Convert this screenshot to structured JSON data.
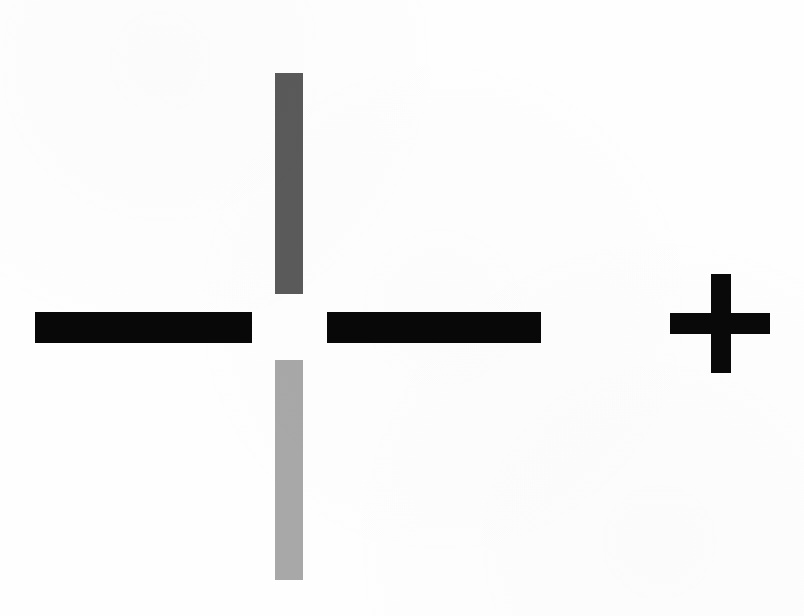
{
  "image": {
    "title": "Registration Crosshair Mark",
    "background_color": "#fefefe",
    "width": 804,
    "height": 616,
    "description": "Scanned registration / alignment target: four rectangular bars forming a crosshair with a central gap, plus a small solid plus sign at right."
  },
  "shapes": {
    "crosshair": {
      "name": "crosshair-registration-mark",
      "center_x": 289,
      "center_y": 327,
      "gap_width": 74,
      "gap_height": 66,
      "arms": [
        {
          "id": "arm-top",
          "orientation": "vertical",
          "color": "#5a5a5a",
          "tone_label": "dark gray",
          "x": 275,
          "y": 73,
          "width": 28,
          "height": 221
        },
        {
          "id": "arm-left",
          "orientation": "horizontal",
          "color": "#080808",
          "tone_label": "black",
          "x": 35,
          "y": 312,
          "width": 217,
          "height": 31
        },
        {
          "id": "arm-right",
          "orientation": "horizontal",
          "color": "#080808",
          "tone_label": "black",
          "x": 327,
          "y": 312,
          "width": 214,
          "height": 31
        },
        {
          "id": "arm-bottom",
          "orientation": "vertical",
          "color": "#a8a8a8",
          "tone_label": "light gray",
          "x": 275,
          "y": 360,
          "width": 28,
          "height": 220
        }
      ]
    },
    "plus": {
      "name": "plus-sign-mark",
      "color": "#090909",
      "center_x": 720,
      "center_y": 323,
      "vertical": {
        "x": 711,
        "y": 274,
        "width": 20,
        "height": 99
      },
      "horizontal": {
        "x": 670,
        "y": 313,
        "width": 100,
        "height": 21
      }
    }
  }
}
